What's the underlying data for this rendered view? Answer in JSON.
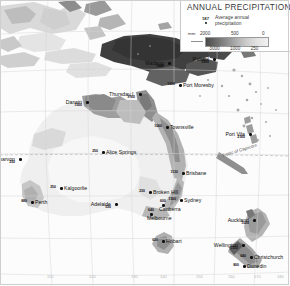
{
  "legend": {
    "title": "ANNUAL PRECIPITATION",
    "key_value": "187",
    "key_line1": "Average annual",
    "key_line2": "precipitation",
    "unit": "mm",
    "ticks_top": [
      "2000",
      "500",
      "0"
    ],
    "ticks_bottom": [
      "3000",
      "1000",
      "250"
    ],
    "ramp_colors": [
      "#4a4a4a",
      "#6d6d6d",
      "#8f8f8f",
      "#b0b0b0",
      "#cdcdcd",
      "#e2e2e2",
      "#f2f2f2"
    ]
  },
  "annotations": {
    "tropic": "Tropic of Capricorn"
  },
  "cities": [
    {
      "name": "Madang",
      "value": "3440",
      "x": 168,
      "y": 62
    },
    {
      "name": "Rabaul",
      "value": "2060",
      "x": 213,
      "y": 58
    },
    {
      "name": "Port Moresby",
      "value": "1000",
      "x": 179,
      "y": 84
    },
    {
      "name": "Thursday I.",
      "value": "1760",
      "x": 139,
      "y": 93
    },
    {
      "name": "Darwin",
      "value": "1500",
      "x": 86,
      "y": 101
    },
    {
      "name": "Townsville",
      "value": "1060",
      "x": 166,
      "y": 126
    },
    {
      "name": "Port Vila",
      "value": "2160",
      "x": 249,
      "y": 133
    },
    {
      "name": "Alice Springs",
      "value": "250",
      "x": 102,
      "y": 151
    },
    {
      "name": "Carnarvon",
      "value": "230",
      "x": 19,
      "y": 158
    },
    {
      "name": "Brisbane",
      "value": "1130",
      "x": 182,
      "y": 172
    },
    {
      "name": "Kalgoorlie",
      "value": "250",
      "x": 60,
      "y": 187
    },
    {
      "name": "Broken Hill",
      "value": "230",
      "x": 149,
      "y": 191
    },
    {
      "name": "Sydney",
      "value": "1160",
      "x": 180,
      "y": 199
    },
    {
      "name": "Perth",
      "value": "880",
      "x": 31,
      "y": 201
    },
    {
      "name": "Adelaide",
      "value": "530",
      "x": 115,
      "y": 203
    },
    {
      "name": "Canberra",
      "value": "600",
      "x": 162,
      "y": 204
    },
    {
      "name": "Auckland",
      "value": "1020",
      "x": 253,
      "y": 219
    },
    {
      "name": "Melbourne",
      "value": "640",
      "x": 150,
      "y": 213
    },
    {
      "name": "Wellington",
      "value": "1150",
      "x": 242,
      "y": 244
    },
    {
      "name": "Hobart",
      "value": "620",
      "x": 162,
      "y": 240
    },
    {
      "name": "Christchurch",
      "value": "640",
      "x": 250,
      "y": 256
    },
    {
      "name": "Dunedin",
      "value": "800",
      "x": 243,
      "y": 265
    }
  ],
  "lon_labels": [
    {
      "label": "110",
      "x": 47
    },
    {
      "label": "120",
      "x": 89
    },
    {
      "label": "130",
      "x": 131
    },
    {
      "label": "140",
      "x": 160
    },
    {
      "label": "150",
      "x": 196
    },
    {
      "label": "160",
      "x": 228
    },
    {
      "label": "170",
      "x": 254
    },
    {
      "label": "180",
      "x": 277
    }
  ]
}
